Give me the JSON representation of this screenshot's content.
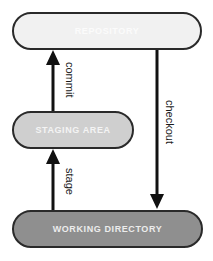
{
  "diagram": {
    "nodes": {
      "repository": {
        "label": "REPOSITORY"
      },
      "staging_area": {
        "label": "STAGING AREA"
      },
      "working_directory": {
        "label": "WORKING DIRECTORY"
      }
    },
    "edges": {
      "commit": {
        "label": "commit",
        "from": "STAGING AREA",
        "to": "REPOSITORY"
      },
      "stage": {
        "label": "stage",
        "from": "WORKING DIRECTORY",
        "to": "STAGING AREA"
      },
      "checkout": {
        "label": "checkout",
        "from": "REPOSITORY",
        "to": "WORKING DIRECTORY"
      }
    },
    "colors": {
      "repository_fill": "#f1f1f1",
      "staging_fill": "#cfcfcf",
      "working_fill": "#8f8f8f",
      "stroke": "#2a2a2a"
    }
  }
}
